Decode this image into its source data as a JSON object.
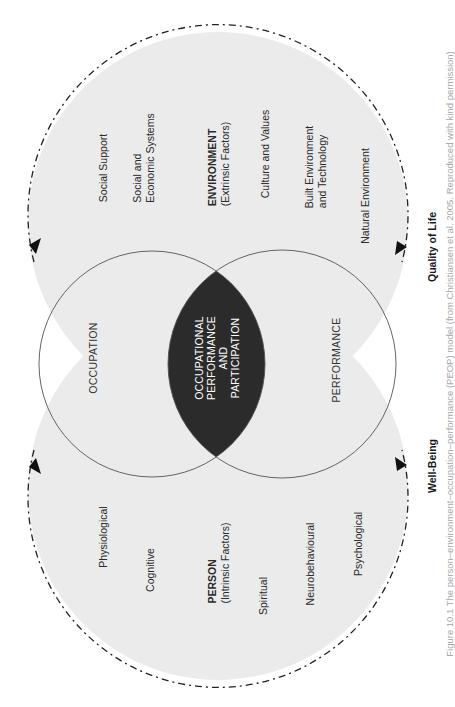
{
  "diagram": {
    "colors": {
      "ring_fill": "#ebebeb",
      "center_fill": "#2b2b2b",
      "circle_stroke": "#555555",
      "dashed_stroke": "#222222",
      "center_text": "#ffffff"
    },
    "environment": {
      "heading": "ENVIRONMENT",
      "subheading": "(Extrinsic Factors)",
      "factors": [
        {
          "label_lines": [
            "Social Support"
          ]
        },
        {
          "label_lines": [
            "Social and",
            "Economic Systems"
          ]
        },
        {
          "label_lines": [
            "Culture and Values"
          ]
        },
        {
          "label_lines": [
            "Built Environment",
            "and Technology"
          ]
        },
        {
          "label_lines": [
            "Natural Environment"
          ]
        }
      ]
    },
    "person": {
      "heading": "PERSON",
      "subheading": "(Intrinsic Factors)",
      "factors": [
        {
          "label_lines": [
            "Physiological"
          ]
        },
        {
          "label_lines": [
            "Cognitive"
          ]
        },
        {
          "label_lines": [
            "Spiritual"
          ]
        },
        {
          "label_lines": [
            "Neurobehavioural"
          ]
        },
        {
          "label_lines": [
            "Psychological"
          ]
        }
      ]
    },
    "circles": {
      "occupation": "OCCUPATION",
      "performance": "PERFORMANCE"
    },
    "center": {
      "lines": [
        "OCCUPATIONAL",
        "PERFORMANCE",
        "AND",
        "PARTICIPATION"
      ]
    },
    "outcomes": {
      "quality_of_life": "Quality of Life",
      "well_being": "Well-Being"
    },
    "caption_fragment": "Figure 10.1  The person–environment–occupation–performance (PEOP) model (from Christiansen et al. 2005. Reproduced with kind permission)"
  }
}
